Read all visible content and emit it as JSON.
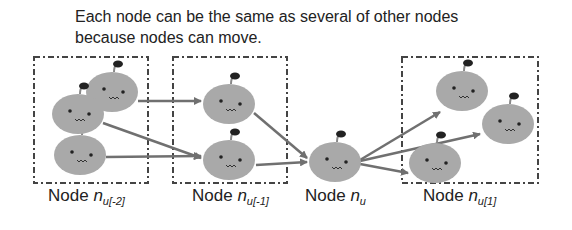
{
  "caption": {
    "line1": "Each node can be the same as several of other nodes",
    "line2": "because nodes can move."
  },
  "labels": [
    {
      "prefix": "Node ",
      "var": "n",
      "sub": "u[-2]"
    },
    {
      "prefix": "Node ",
      "var": "n",
      "sub": "u[-1]"
    },
    {
      "prefix": "Node ",
      "var": "n",
      "sub": "u"
    },
    {
      "prefix": "Node ",
      "var": "n",
      "sub": "u[1]"
    }
  ],
  "colors": {
    "node_fill": "#a9a9a9",
    "arrow": "#707070",
    "box_border": "#444444",
    "text": "#222222"
  }
}
